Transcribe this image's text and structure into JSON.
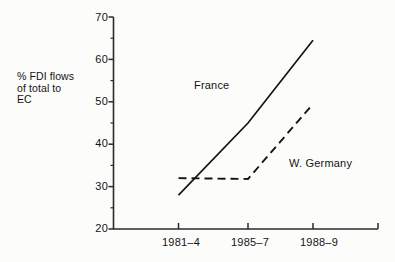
{
  "chart_data": {
    "type": "line",
    "title": "",
    "xlabel": "",
    "ylabel": "% FDI flows of total to EC",
    "ylabel_lines": [
      "% FDI flows",
      "of total to",
      "EC"
    ],
    "categories": [
      "1981–4",
      "1985–7",
      "1988–9"
    ],
    "ylim": [
      20,
      70
    ],
    "y_ticks": [
      20,
      30,
      40,
      50,
      60,
      70
    ],
    "y_minor_ticks": [
      25,
      35,
      45,
      55,
      65
    ],
    "y_tick_labels": [
      "20",
      "30",
      "40",
      "50",
      "60",
      "70"
    ],
    "grid": false,
    "legend": "inline-annotations",
    "series": [
      {
        "name": "France",
        "style": "solid",
        "color": "#141414",
        "values": [
          28,
          45,
          64.5
        ],
        "label_text": "France"
      },
      {
        "name": "W. Germany",
        "style": "dashed",
        "color": "#141414",
        "values": [
          32,
          31.8,
          49.5
        ],
        "label_text": "W. Germany"
      }
    ],
    "annotations": [
      {
        "text": "France",
        "series": "France"
      },
      {
        "text": "W. Germany",
        "series": "W. Germany"
      }
    ]
  },
  "colors": {
    "background": "#fcfcfa",
    "ink": "#141414",
    "axis": "#2b2b2b"
  }
}
